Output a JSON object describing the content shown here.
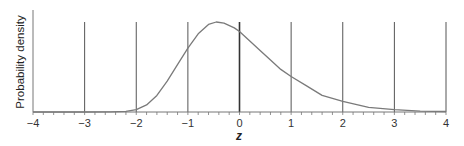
{
  "chart_data": {
    "type": "line",
    "title": "",
    "xlabel": "z",
    "ylabel": "Probability density",
    "xlim": [
      -4,
      4
    ],
    "ylim": [
      0,
      0.45
    ],
    "xticks": [
      "−4",
      "−3",
      "−2",
      "−1",
      "0",
      "1",
      "2",
      "3",
      "4"
    ],
    "xtick_values": [
      -4,
      -3,
      -2,
      -1,
      0,
      1,
      2,
      3,
      4
    ],
    "minor_ticks_per_unit": 5,
    "grid": "vertical lines at integer z",
    "legend": null,
    "series": [
      {
        "name": "density",
        "x": [
          -4,
          -3,
          -2.5,
          -2.2,
          -2,
          -1.8,
          -1.6,
          -1.4,
          -1.2,
          -1,
          -0.8,
          -0.6,
          -0.45,
          -0.3,
          -0.1,
          0,
          0.2,
          0.4,
          0.6,
          0.8,
          1,
          1.3,
          1.6,
          2,
          2.5,
          3,
          3.5,
          4
        ],
        "values": [
          0,
          0,
          0.0005,
          0.003,
          0.01,
          0.03,
          0.07,
          0.13,
          0.2,
          0.27,
          0.33,
          0.37,
          0.38,
          0.375,
          0.355,
          0.34,
          0.3,
          0.26,
          0.22,
          0.18,
          0.15,
          0.11,
          0.07,
          0.045,
          0.02,
          0.01,
          0.004,
          0.002
        ]
      }
    ]
  },
  "colors": {
    "curve": "#7a7a7a",
    "axis": "#666666",
    "gridline": "#555555",
    "zero_line": "#333333"
  }
}
